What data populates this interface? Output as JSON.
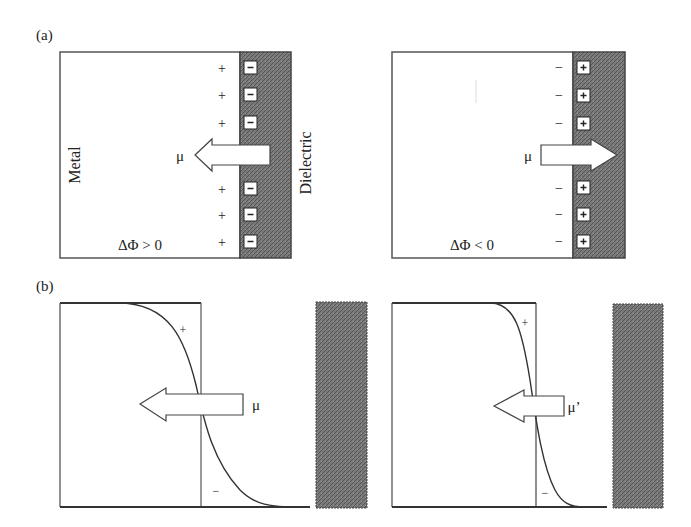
{
  "figure": {
    "panel_a": {
      "label": "(a)",
      "left": {
        "metal_label": "Metal",
        "dielectric_label": "Dielectric",
        "metal_charge": "+",
        "dielectric_charge": "−",
        "dipole_label": "μ",
        "dipole_direction": "left",
        "condition": "ΔΦ > 0"
      },
      "right": {
        "metal_charge": "−",
        "dielectric_charge": "+",
        "dipole_label": "μ",
        "dipole_direction": "right",
        "condition": "ΔΦ < 0"
      }
    },
    "panel_b": {
      "label": "(b)",
      "left": {
        "plus": "+",
        "minus": "−",
        "dipole_label": "μ"
      },
      "right": {
        "plus": "+",
        "minus": "−",
        "dipole_label": "μ’"
      }
    },
    "colors": {
      "dielectric_fill": "#6e6e6e",
      "line": "#333333",
      "text": "#222222"
    }
  }
}
